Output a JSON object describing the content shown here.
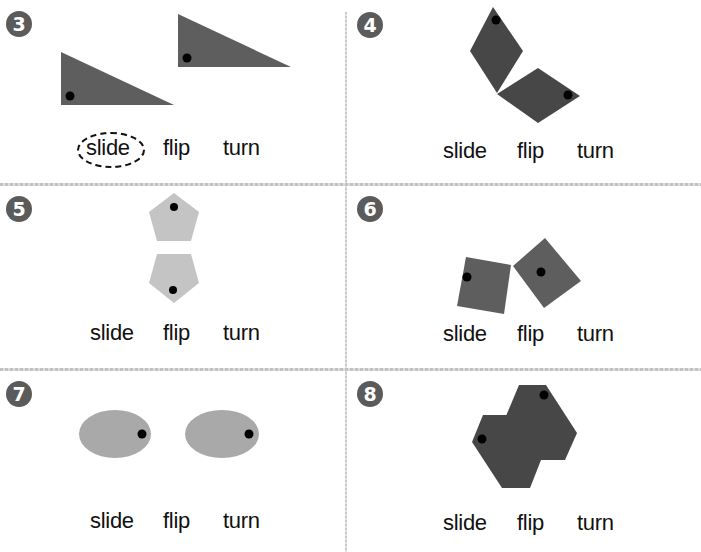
{
  "worksheet": {
    "instruction_options": [
      "slide",
      "flip",
      "turn"
    ],
    "colors": {
      "dark_shape": "#5e5e5e",
      "darker_shape": "#474747",
      "light_shape": "#c4c4c4",
      "dot": "#000000",
      "badge": "#5b5b5b"
    },
    "problems": [
      {
        "number": "3",
        "shape": "right-triangle",
        "options": [
          "slide",
          "flip",
          "turn"
        ],
        "circled": "slide"
      },
      {
        "number": "4",
        "shape": "rhombus",
        "options": [
          "slide",
          "flip",
          "turn"
        ],
        "circled": null
      },
      {
        "number": "5",
        "shape": "pentagon",
        "options": [
          "slide",
          "flip",
          "turn"
        ],
        "circled": null
      },
      {
        "number": "6",
        "shape": "square",
        "options": [
          "slide",
          "flip",
          "turn"
        ],
        "circled": null
      },
      {
        "number": "7",
        "shape": "oval",
        "options": [
          "slide",
          "flip",
          "turn"
        ],
        "circled": null
      },
      {
        "number": "8",
        "shape": "hexagon",
        "options": [
          "slide",
          "flip",
          "turn"
        ],
        "circled": null
      }
    ]
  }
}
